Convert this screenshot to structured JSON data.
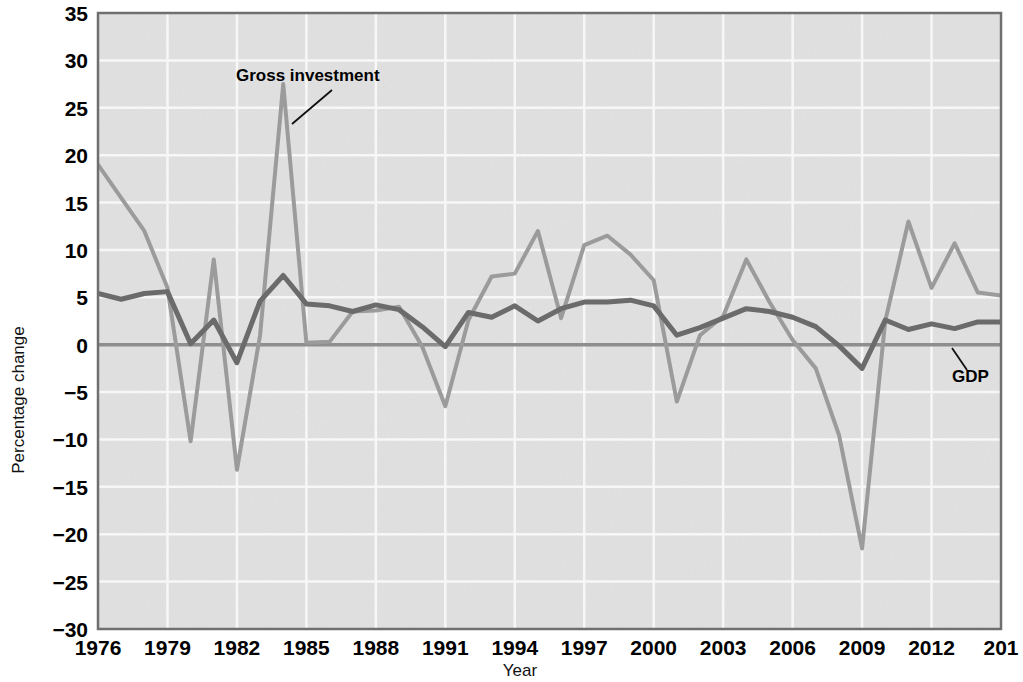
{
  "chart_data": {
    "type": "line",
    "title": "",
    "xlabel": "Year",
    "ylabel": "Percentage change",
    "xlim": [
      1976,
      2015
    ],
    "ylim": [
      -30,
      35
    ],
    "ytick_step": 5,
    "xtick_step": 3,
    "grid": true,
    "legend_position": "inline-annotations",
    "ytick_labels": [
      "35",
      "30",
      "25",
      "20",
      "15",
      "10",
      "5",
      "0",
      "−5",
      "−10",
      "−15",
      "−20",
      "−25",
      "−30"
    ],
    "ytick_values": [
      35,
      30,
      25,
      20,
      15,
      10,
      5,
      0,
      -5,
      -10,
      -15,
      -20,
      -25,
      -30
    ],
    "xtick_labels": [
      "1976",
      "1979",
      "1982",
      "1985",
      "1988",
      "1991",
      "1994",
      "1997",
      "2000",
      "2003",
      "2006",
      "2009",
      "2012",
      "201"
    ],
    "xtick_values": [
      1976,
      1979,
      1982,
      1985,
      1988,
      1991,
      1994,
      1997,
      2000,
      2003,
      2006,
      2009,
      2012,
      2015
    ],
    "x": [
      1976,
      1977,
      1978,
      1979,
      1980,
      1981,
      1982,
      1983,
      1984,
      1985,
      1986,
      1987,
      1988,
      1989,
      1990,
      1991,
      1992,
      1993,
      1994,
      1995,
      1996,
      1997,
      1998,
      1999,
      2000,
      2001,
      2002,
      2003,
      2004,
      2005,
      2006,
      2007,
      2008,
      2009,
      2010,
      2011,
      2012,
      2013,
      2014,
      2015
    ],
    "series": [
      {
        "name": "Gross investment",
        "color": "#9b9b9b",
        "width": 4,
        "values": [
          19.0,
          15.5,
          12.0,
          6.0,
          -10.2,
          9.0,
          -13.2,
          1.0,
          27.5,
          0.2,
          0.3,
          3.5,
          3.6,
          4.0,
          -0.2,
          -6.5,
          2.6,
          7.2,
          7.5,
          12.0,
          2.8,
          10.5,
          11.5,
          9.5,
          6.8,
          -6.0,
          1.0,
          3.0,
          9.0,
          4.5,
          0.5,
          -2.5,
          -9.5,
          -21.5,
          2.5,
          13.0,
          6.0,
          10.7,
          5.5,
          5.2
        ]
      },
      {
        "name": "GDP",
        "color": "#6b6b6b",
        "width": 5,
        "values": [
          5.4,
          4.8,
          5.4,
          5.6,
          0.1,
          2.6,
          -1.9,
          4.6,
          7.3,
          4.3,
          4.1,
          3.5,
          4.2,
          3.7,
          1.9,
          -0.2,
          3.4,
          2.9,
          4.1,
          2.5,
          3.8,
          4.5,
          4.5,
          4.7,
          4.1,
          1.0,
          1.8,
          2.8,
          3.8,
          3.5,
          2.9,
          1.9,
          -0.1,
          -2.5,
          2.6,
          1.6,
          2.2,
          1.7,
          2.4,
          2.4
        ]
      }
    ],
    "annotations": [
      {
        "name": "gross-investment-label",
        "text": "Gross investment",
        "text_x": 236,
        "text_y": 81,
        "leader": {
          "x1": 332,
          "y1": 90,
          "x2": 292,
          "y2": 124
        }
      },
      {
        "name": "gdp-label",
        "text": "GDP",
        "text_x": 952,
        "text_y": 382,
        "leader": {
          "x1": 967,
          "y1": 370,
          "x2": 952,
          "y2": 348
        }
      }
    ],
    "plot_area": {
      "left": 98,
      "top": 13,
      "right": 1001,
      "bottom": 629
    },
    "plot_bg": "#e0e0e0",
    "gridline_color": "#f7f7f7",
    "zero_line_color": "#8e8e8e",
    "border_color": "#6f6f6f"
  }
}
